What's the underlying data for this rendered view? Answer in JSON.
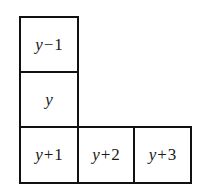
{
  "diagram": {
    "cells": [
      {
        "id": "y-minus-1",
        "var": "y",
        "op": "−",
        "num": "1",
        "x": 19,
        "y": 16,
        "w": 60,
        "h": 57
      },
      {
        "id": "y",
        "var": "y",
        "op": "",
        "num": "",
        "x": 19,
        "y": 71,
        "w": 60,
        "h": 57
      },
      {
        "id": "y-plus-1",
        "var": "y",
        "op": "+",
        "num": "1",
        "x": 19,
        "y": 126,
        "w": 60,
        "h": 58
      },
      {
        "id": "y-plus-2",
        "var": "y",
        "op": "+",
        "num": "2",
        "x": 77,
        "y": 126,
        "w": 58,
        "h": 58
      },
      {
        "id": "y-plus-3",
        "var": "y",
        "op": "+",
        "num": "3",
        "x": 133,
        "y": 126,
        "w": 59,
        "h": 58
      }
    ],
    "border_color": "#111111",
    "background": "#ffffff"
  }
}
